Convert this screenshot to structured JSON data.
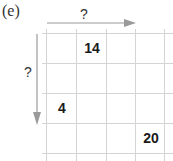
{
  "label": "(e)",
  "axis_labels": {
    "horizontal": "?",
    "vertical": "?"
  },
  "grid": {
    "rows": 4,
    "cols": 4,
    "cells": [
      {
        "row": 0,
        "col": 1,
        "value": "14"
      },
      {
        "row": 2,
        "col": 0,
        "value": "4"
      },
      {
        "row": 3,
        "col": 3,
        "value": "20"
      }
    ]
  },
  "colors": {
    "grid": "#d4d4d4",
    "arrow": "#9a9a9a",
    "text": "#1a1a1a"
  }
}
